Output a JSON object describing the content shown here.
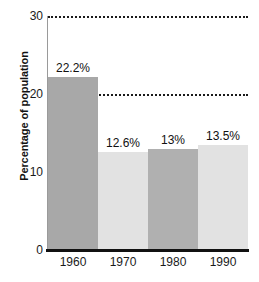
{
  "chart_data": {
    "type": "bar",
    "title": "",
    "xlabel": "",
    "ylabel": "Percentage of population",
    "categories": [
      "1960",
      "1970",
      "1980",
      "1990"
    ],
    "values": [
      22.2,
      12.6,
      13,
      13.5
    ],
    "data_labels": [
      "22.2%",
      "12.6%",
      "13%",
      "13.5%"
    ],
    "ylim": [
      0,
      30
    ],
    "yticks": [
      "0",
      "10",
      "20",
      "30"
    ],
    "ytick_values": [
      0,
      10,
      20,
      30
    ],
    "gridlines": [
      10,
      20,
      30
    ],
    "grid": true,
    "legend": "none",
    "series": [
      {
        "name": "Percentage of population",
        "values": [
          22.2,
          12.6,
          13,
          13.5
        ]
      }
    ],
    "bar_colors": [
      "#a8a8a8",
      "#e2e2e2",
      "#b0b0b0",
      "#e2e2e2"
    ],
    "colors": {
      "bar_dark": "#a8a8a8",
      "bar_light": "#e2e2e2",
      "axis": "#111111",
      "gridline": "#1a1a1a",
      "text": "#111111",
      "background": "#ffffff"
    }
  },
  "caption_remnant": ""
}
